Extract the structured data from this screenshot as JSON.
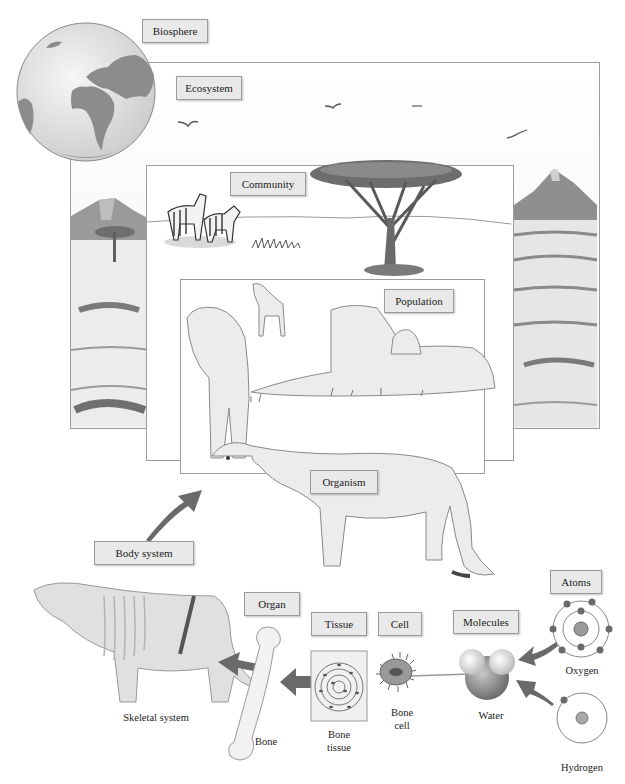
{
  "diagram": {
    "levels": [
      {
        "id": "biosphere",
        "label": "Biosphere"
      },
      {
        "id": "ecosystem",
        "label": "Ecosystem"
      },
      {
        "id": "community",
        "label": "Community"
      },
      {
        "id": "population",
        "label": "Population"
      },
      {
        "id": "organism",
        "label": "Organism"
      },
      {
        "id": "body_system",
        "label": "Body system"
      },
      {
        "id": "organ",
        "label": "Organ"
      },
      {
        "id": "tissue",
        "label": "Tissue"
      },
      {
        "id": "cell",
        "label": "Cell"
      },
      {
        "id": "molecules",
        "label": "Molecules"
      },
      {
        "id": "atoms",
        "label": "Atoms"
      }
    ],
    "captions": {
      "skeletal_system": "Skeletal system",
      "bone": "Bone",
      "bone_tissue_line1": "Bone",
      "bone_tissue_line2": "tissue",
      "bone_cell_line1": "Bone",
      "bone_cell_line2": "cell",
      "water": "Water",
      "oxygen": "Oxygen",
      "hydrogen": "Hydrogen"
    },
    "colors": {
      "label_bg": "#e9e9e9",
      "label_border": "#9a9a9a",
      "arrow": "#6a6a6a",
      "globe_land": "#8c8c8c",
      "globe_ocean": "#e4e4e4"
    }
  }
}
